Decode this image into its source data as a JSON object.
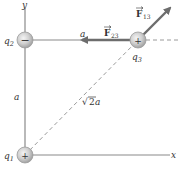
{
  "diagram": {
    "type": "physics-charge-configuration",
    "axes": {
      "x_label": "x",
      "y_label": "y"
    },
    "charges": [
      {
        "id": "q1",
        "name": "q",
        "sub": "1",
        "sign": "+",
        "position": "origin"
      },
      {
        "id": "q2",
        "name": "q",
        "sub": "2",
        "sign": "−",
        "position": "on y-axis at distance a"
      },
      {
        "id": "q3",
        "name": "q",
        "sub": "3",
        "sign": "+",
        "position": "at (a, a)"
      }
    ],
    "distances": {
      "vertical": "a",
      "horizontal": "a",
      "diagonal_root": "√",
      "diagonal_num": "2",
      "diagonal_var": "a"
    },
    "forces": [
      {
        "id": "F23",
        "symbol": "F",
        "sub": "23",
        "direction": "left (toward q2)"
      },
      {
        "id": "F13",
        "symbol": "F",
        "sub": "13",
        "direction": "up-right (away from q1)"
      }
    ],
    "colors": {
      "axis": "#7a7a7a",
      "force_arrow": "#6d6d6d",
      "dashed": "#9a9a9a",
      "charge_fill": "#c9c9c9",
      "charge_edge": "#9c9c9c",
      "text": "#333333"
    }
  }
}
